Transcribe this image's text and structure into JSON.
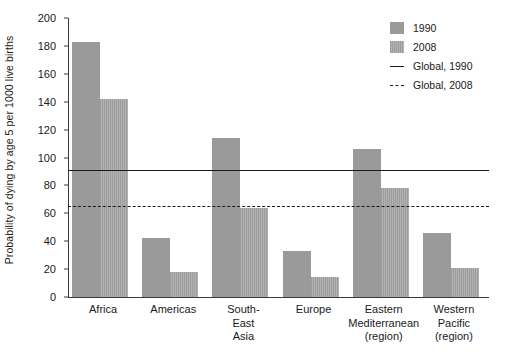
{
  "chart_data": {
    "type": "bar",
    "title": "",
    "subtitle": "",
    "xlabel": "",
    "ylabel": "Probability of dying by age 5 per 1000 live births",
    "ylim": [
      0,
      200
    ],
    "y_ticks": [
      0,
      20,
      40,
      60,
      80,
      100,
      120,
      140,
      160,
      180,
      200
    ],
    "grid": false,
    "legend_position": "top-right",
    "categories": [
      "Africa",
      "Americas",
      "South-East Asia",
      "Europe",
      "Eastern Mediterranean (region)",
      "Western Pacific (region)"
    ],
    "category_lines": [
      [
        "Africa"
      ],
      [
        "Americas"
      ],
      [
        "South-",
        "East",
        "Asia"
      ],
      [
        "Europe"
      ],
      [
        "Eastern",
        "Mediterranean",
        "(region)"
      ],
      [
        "Western",
        "Pacific",
        "(region)"
      ]
    ],
    "series": [
      {
        "name": "1990",
        "style": "solid-fill",
        "color": "#9a9a9a",
        "values": [
          183,
          42,
          114,
          33,
          106,
          46
        ]
      },
      {
        "name": "2008",
        "style": "striped-fill",
        "color": "#a8a8a8",
        "values": [
          142,
          18,
          64,
          14,
          78,
          21
        ]
      }
    ],
    "reference_lines": [
      {
        "name": "Global, 1990",
        "value": 91,
        "style": "solid",
        "color": "#1a1a1a"
      },
      {
        "name": "Global, 2008",
        "value": 65,
        "style": "dashed",
        "color": "#1a1a1a"
      }
    ]
  },
  "legend": {
    "entries": [
      {
        "label": "1990",
        "key": "swatch-solid"
      },
      {
        "label": "2008",
        "key": "swatch-striped"
      },
      {
        "label": "Global, 1990",
        "key": "line-solid"
      },
      {
        "label": "Global, 2008",
        "key": "line-dashed"
      }
    ]
  }
}
